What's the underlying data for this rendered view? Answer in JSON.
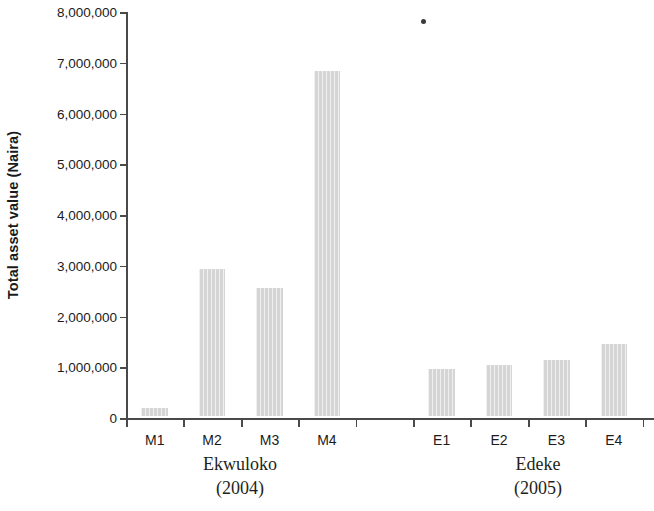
{
  "chart_data": {
    "type": "bar",
    "title": "",
    "subtitle": "",
    "xlabel": "",
    "ylabel": "Total asset value (Naira)",
    "categories": [
      "M1",
      "M2",
      "M3",
      "M4",
      "",
      "E1",
      "E2",
      "E3",
      "E4"
    ],
    "values": [
      150000,
      2900000,
      2520000,
      6800000,
      0,
      930000,
      1010000,
      1110000,
      1410000
    ],
    "series": [
      {
        "name": "Total asset value",
        "values": [
          150000,
          2900000,
          2520000,
          6800000,
          0,
          930000,
          1010000,
          1110000,
          1410000
        ]
      }
    ],
    "ylim": [
      0,
      8000000
    ],
    "ytick_values": [
      0,
      1000000,
      2000000,
      3000000,
      4000000,
      5000000,
      6000000,
      7000000,
      8000000
    ],
    "ytick_labels": [
      "0",
      "1,000,000",
      "2,000,000",
      "3,000,000",
      "4,000,000",
      "5,000,000",
      "6,000,000",
      "7,000,000",
      "8,000,000"
    ],
    "grid": false,
    "legend": null,
    "bar_color": "#dddddd",
    "axis_color": "#4a4a4a",
    "text_color": "#1b1b1b",
    "groups": [
      {
        "name": "Ekwuloko",
        "year": "(2004)",
        "categories": [
          "M1",
          "M2",
          "M3",
          "M4"
        ]
      },
      {
        "name": "Edeke",
        "year": "(2005)",
        "categories": [
          "E1",
          "E2",
          "E3",
          "E4"
        ]
      }
    ],
    "annotations": [
      {
        "name": "stray-dot",
        "x_px": 424,
        "y_px": 22
      }
    ]
  }
}
